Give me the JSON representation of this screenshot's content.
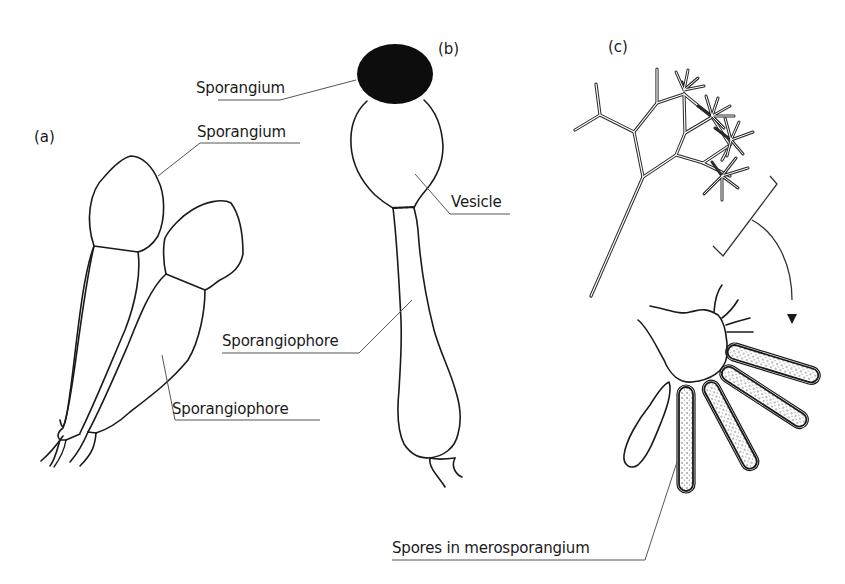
{
  "figure": {
    "panels": [
      {
        "id": "a",
        "label": "(a)"
      },
      {
        "id": "b",
        "label": "(b)"
      },
      {
        "id": "c",
        "label": "(c)"
      }
    ],
    "labels": {
      "a_sporangium": "Sporangium",
      "a_sporangiophore": "Sporangiophore",
      "b_sporangium": "Sporangium",
      "b_vesicle": "Vesicle",
      "b_sporangiophore": "Sporangiophore",
      "c_spores": "Spores in merosporangium"
    },
    "colors": {
      "stroke": "#1a1a1a",
      "leader": "#555555",
      "sporangium_fill": "#0d0d0d",
      "background": "#ffffff"
    }
  }
}
